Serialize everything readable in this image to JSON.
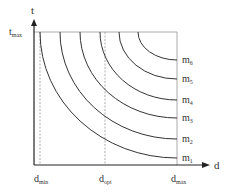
{
  "diagram": {
    "y_axis": {
      "label": "t",
      "top_label": "t",
      "top_sub": "max"
    },
    "x_axis": {
      "label": "d"
    },
    "x_markers": [
      {
        "main": "d",
        "sub": "min",
        "x": 40,
        "dashed": true
      },
      {
        "main": "d",
        "sub": "opt",
        "x": 105,
        "dashed": true
      },
      {
        "main": "d",
        "sub": "max",
        "x": 177,
        "dashed": false
      }
    ],
    "curves": [
      {
        "main": "m",
        "sub": "1",
        "start_x": 40,
        "end_y": 158
      },
      {
        "main": "m",
        "sub": "2",
        "start_x": 60,
        "end_y": 139
      },
      {
        "main": "m",
        "sub": "3",
        "start_x": 80,
        "end_y": 118
      },
      {
        "main": "m",
        "sub": "4",
        "start_x": 100,
        "end_y": 100
      },
      {
        "main": "m",
        "sub": "5",
        "start_x": 119,
        "end_y": 79
      },
      {
        "main": "m",
        "sub": "6",
        "start_x": 138,
        "end_y": 60
      }
    ],
    "colors": {
      "axis": "#222222",
      "curve": "#333333",
      "frame": "#aaaaaa",
      "dashed": "#999999"
    }
  }
}
